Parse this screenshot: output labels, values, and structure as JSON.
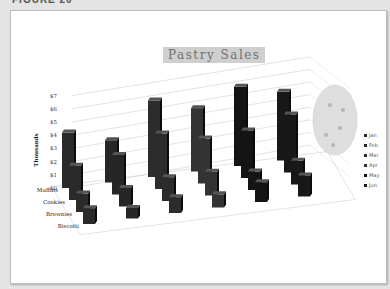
{
  "figure_header": "FIGURE 20",
  "chart_data": {
    "type": "bar",
    "subtype": "3d-column",
    "title": "Pastry Sales",
    "ylabel": "Thousands",
    "xlabel": "",
    "ylim": [
      0,
      7
    ],
    "y_ticks": [
      "$0",
      "$1",
      "$2",
      "$3",
      "$4",
      "$5",
      "$6",
      "$7"
    ],
    "categories": [
      "Muffins",
      "Cookies",
      "Brownies",
      "Biscotti"
    ],
    "series": [
      {
        "name": "Jan",
        "color": "#2a2a2a",
        "values": [
          4.2,
          2.6,
          1.4,
          1.2
        ]
      },
      {
        "name": "Feb",
        "color": "#262626",
        "values": [
          3.2,
          3.0,
          1.4,
          0.8
        ]
      },
      {
        "name": "Mar",
        "color": "#2c2c2c",
        "values": [
          5.8,
          4.2,
          1.8,
          1.2
        ]
      },
      {
        "name": "Apr",
        "color": "#333333",
        "values": [
          4.8,
          3.4,
          1.8,
          1.0
        ]
      },
      {
        "name": "May",
        "color": "#141414",
        "values": [
          6.0,
          3.6,
          1.4,
          1.5
        ]
      },
      {
        "name": "Jun",
        "color": "#181818",
        "values": [
          5.2,
          4.4,
          1.8,
          1.6
        ]
      }
    ],
    "legend_position": "right",
    "grid": true,
    "background_decoration": "cookie-image"
  }
}
